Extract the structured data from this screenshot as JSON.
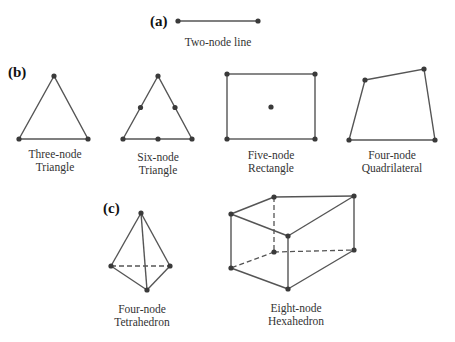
{
  "diagram": {
    "panels": [
      {
        "id": "a",
        "label": "(a)",
        "elements": [
          {
            "name": "two-node-line",
            "caption_lines": [
              "Two-node line"
            ],
            "nodes": 2
          }
        ]
      },
      {
        "id": "b",
        "label": "(b)",
        "elements": [
          {
            "name": "three-node-triangle",
            "caption_lines": [
              "Three-node",
              "Triangle"
            ],
            "nodes": 3
          },
          {
            "name": "six-node-triangle",
            "caption_lines": [
              "Six-node",
              "Triangle"
            ],
            "nodes": 6
          },
          {
            "name": "five-node-rectangle",
            "caption_lines": [
              "Five-node",
              "Rectangle"
            ],
            "nodes": 5
          },
          {
            "name": "four-node-quadrilateral",
            "caption_lines": [
              "Four-node",
              "Quadrilateral"
            ],
            "nodes": 4
          }
        ]
      },
      {
        "id": "c",
        "label": "(c)",
        "elements": [
          {
            "name": "four-node-tetrahedron",
            "caption_lines": [
              "Four-node",
              "Tetrahedron"
            ],
            "nodes": 4
          },
          {
            "name": "eight-node-hexahedron",
            "caption_lines": [
              "Eight-node",
              "Hexahedron"
            ],
            "nodes": 8
          }
        ]
      }
    ],
    "colors": {
      "edge": "#555555",
      "node": "#3a3a3a",
      "text": "#333333",
      "background": "#ffffff"
    }
  }
}
